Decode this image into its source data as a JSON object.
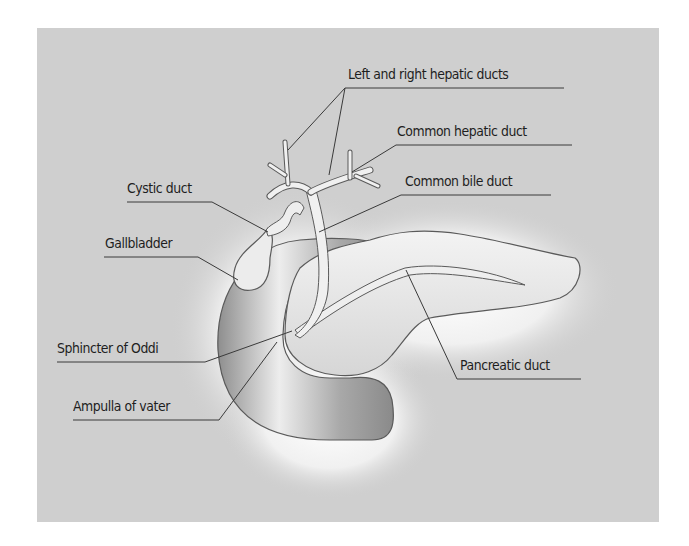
{
  "figure": {
    "colors": {
      "background": "#cfcfcf",
      "glow": "#ffffff",
      "organ_dark": "#9a9a9a",
      "organ_light": "#e6e6e6",
      "outline": "#5a5a5a",
      "leader_line": "#3a3a3a"
    }
  },
  "labels": {
    "left_right_hepatic_ducts": "Left and right hepatic ducts",
    "common_hepatic_duct": "Common hepatic duct",
    "common_bile_duct": "Common bile duct",
    "cystic_duct": "Cystic duct",
    "gallbladder": "Gallbladder",
    "sphincter_of_oddi": "Sphincter of Oddi",
    "ampulla_of_vater": "Ampulla of vater",
    "pancreatic_duct": "Pancreatic duct"
  }
}
